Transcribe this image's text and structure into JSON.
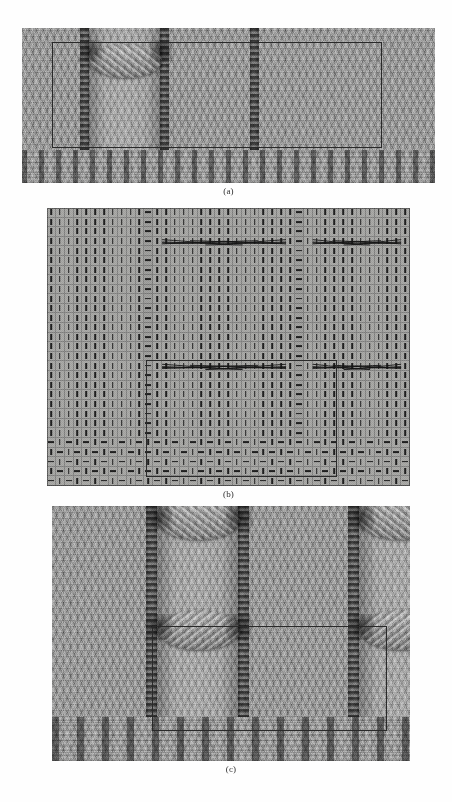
{
  "figure": {
    "panels": [
      {
        "id": "a",
        "caption": "(a)",
        "description": "rendered cable-knit swatch, wide aspect",
        "x": 22,
        "y": 28,
        "width": 413,
        "height": 155,
        "caption_y": 186,
        "background_color": "#9c9c9a",
        "purl_columns_px": [
          62,
          142,
          232
        ],
        "cable_columns": [
          {
            "left": 66,
            "width": 74
          }
        ],
        "rib_height": 33,
        "highlight_rect": {
          "x": 30,
          "y": 14,
          "width": 328,
          "height": 104
        }
      },
      {
        "id": "b",
        "caption": "(b)",
        "description": "knitting stitch chart: knit, purl and cable-cross symbols",
        "x": 47,
        "y": 208,
        "width": 363,
        "height": 278,
        "caption_y": 489,
        "background_color": "#a3a3a1",
        "grid": {
          "columns": 41,
          "rows": 29
        },
        "legend": [
          {
            "symbol": "vertical-dash",
            "name": "knit-stitch",
            "meaning": "knit on right side"
          },
          {
            "symbol": "horizontal-dash",
            "name": "purl-stitch",
            "meaning": "purl on right side"
          },
          {
            "symbol": "x-cross",
            "name": "cable-cross",
            "meaning": "cable crossing over 6 stitches"
          }
        ],
        "purl_column_indices": [
          11,
          28
        ],
        "cable_rows": [
          3,
          16
        ],
        "cable_spans": [
          {
            "row": 3,
            "start_col": 13,
            "end_col": 26
          },
          {
            "row": 3,
            "start_col": 30,
            "end_col": 39
          },
          {
            "row": 16,
            "start_col": 13,
            "end_col": 26
          },
          {
            "row": 16,
            "start_col": 30,
            "end_col": 39
          }
        ],
        "rib_rows": 5,
        "rib_pattern": "1x1 rib (alternating purl / knit)",
        "repeat_box": {
          "x": 99,
          "y": 152,
          "width": 189,
          "height": 115
        }
      },
      {
        "id": "c",
        "caption": "(c)",
        "description": "rendered cable-knit swatch, close-up with two cable panels",
        "x": 52,
        "y": 506,
        "width": 358,
        "height": 255,
        "caption_y": 766,
        "background_color": "#97979a",
        "purl_columns_px": [
          98,
          188,
          232,
          300
        ],
        "cable_columns": [
          {
            "left": 104,
            "width": 84
          },
          {
            "left": 306,
            "width": 84
          }
        ],
        "rib_height": 44,
        "highlight_rect": {
          "x": 100,
          "y": 120,
          "width": 233,
          "height": 103
        }
      }
    ]
  },
  "chart_data": {
    "type": "table",
    "title": "",
    "xlabel": "",
    "ylabel": "",
    "symbols": {
      "knit": "vertical dash",
      "purl": "horizontal dash",
      "cable": "X crossing"
    },
    "columns": 41,
    "rows": 29
  }
}
